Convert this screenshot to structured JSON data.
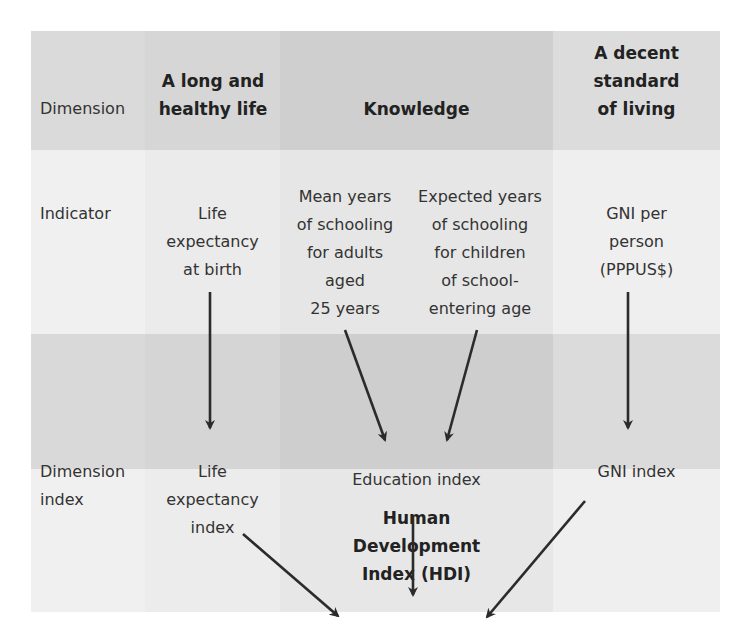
{
  "rows": {
    "dimension": "Dimension",
    "indicator": "Indicator",
    "dimension_index": [
      "Dimension",
      "index"
    ]
  },
  "dimensions": {
    "health": [
      "A long and",
      "healthy life"
    ],
    "knowledge": "Knowledge",
    "living": [
      "A decent",
      "standard",
      "of living"
    ]
  },
  "indicators": {
    "life_expectancy": [
      "Life",
      "expectancy",
      "at birth"
    ],
    "mean_schooling": [
      "Mean years",
      "of schooling",
      "for adults",
      "aged",
      "25 years"
    ],
    "expected_schooling": [
      "Expected years",
      "of schooling",
      "for children",
      "of school-",
      "entering age"
    ],
    "gni": [
      "GNI per",
      "person",
      "(PPPUS$)"
    ]
  },
  "indices": {
    "life_expectancy": [
      "Life",
      "expectancy",
      "index"
    ],
    "education": "Education index",
    "gni": "GNI index"
  },
  "result": [
    "Human",
    "Development",
    "Index (HDI)"
  ],
  "colors": {
    "band_header_a": "#dcdcdc",
    "band_header_b": "#d6d6d6",
    "band_header_k": "#cfcfcf",
    "band_light_a": "#f0f0f0",
    "band_light_b": "#ececec",
    "band_light_k": "#e6e6e6",
    "arrow": "#2b2b2b"
  }
}
